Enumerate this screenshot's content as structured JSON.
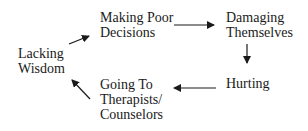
{
  "diagram": {
    "type": "cycle",
    "nodes": [
      {
        "id": "lacking-wisdom",
        "lines": [
          "Lacking",
          "Wisdom"
        ]
      },
      {
        "id": "making-poor-decisions",
        "lines": [
          "Making Poor",
          "Decisions"
        ]
      },
      {
        "id": "damaging-themselves",
        "lines": [
          "Damaging",
          "Themselves"
        ]
      },
      {
        "id": "hurting",
        "lines": [
          "Hurting"
        ]
      },
      {
        "id": "going-to-therapists",
        "lines": [
          "Going To",
          "Therapists/",
          "Counselors"
        ]
      }
    ],
    "edges": [
      {
        "from": "lacking-wisdom",
        "to": "making-poor-decisions"
      },
      {
        "from": "making-poor-decisions",
        "to": "damaging-themselves"
      },
      {
        "from": "damaging-themselves",
        "to": "hurting"
      },
      {
        "from": "hurting",
        "to": "going-to-therapists"
      },
      {
        "from": "going-to-therapists",
        "to": "lacking-wisdom"
      }
    ],
    "colors": {
      "text": "#1a1a1a",
      "arrow": "#1a1a1a",
      "background": "#ffffff"
    }
  }
}
